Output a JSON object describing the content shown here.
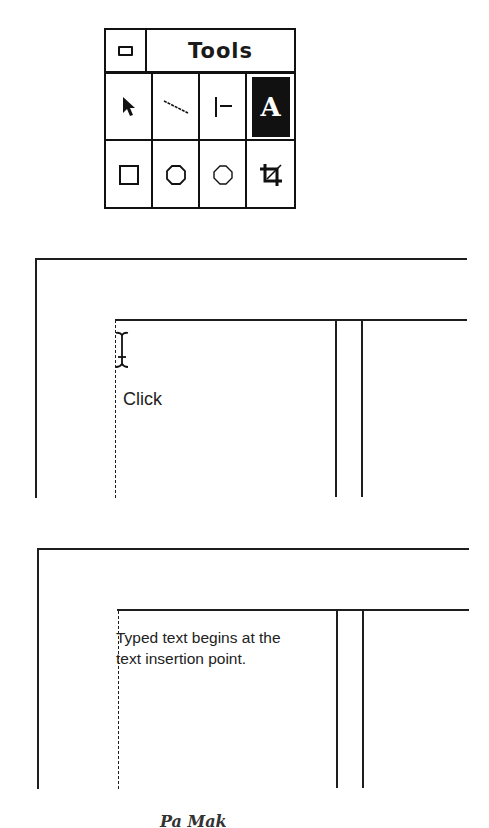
{
  "tools_palette": {
    "title": "Tools",
    "close_box": "control-menu-box",
    "tools": [
      {
        "name": "pointer-tool",
        "icon": "arrow-pointer-icon",
        "selected": false
      },
      {
        "name": "diagonal-line-tool",
        "icon": "diagonal-line-icon",
        "selected": false
      },
      {
        "name": "perpendicular-line-tool",
        "icon": "perpendicular-line-icon",
        "selected": false
      },
      {
        "name": "text-tool",
        "icon": "text-A-icon",
        "label": "A",
        "selected": true
      },
      {
        "name": "rectangle-tool",
        "icon": "square-icon",
        "selected": false
      },
      {
        "name": "rounded-rectangle-tool",
        "icon": "rounded-square-icon",
        "selected": false
      },
      {
        "name": "oval-tool",
        "icon": "circle-icon",
        "selected": false
      },
      {
        "name": "cropping-tool",
        "icon": "crop-icon",
        "selected": false
      }
    ]
  },
  "diagram_1": {
    "cursor": "i-beam-cursor-icon",
    "annotation": "Click"
  },
  "diagram_2": {
    "typed_text_line1": "Typed text begins at the",
    "typed_text_line2": "text insertion point."
  },
  "footer": {
    "partial_caption": "Pa  Mak"
  }
}
